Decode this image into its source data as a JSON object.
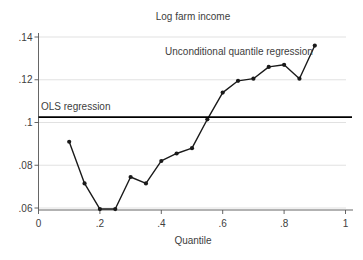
{
  "chart_data": {
    "type": "line",
    "title": "Log farm income",
    "xlabel": "Quantile",
    "ylabel": "",
    "xlim": [
      0,
      1.03
    ],
    "ylim": [
      0.055,
      0.142
    ],
    "grid": "horizontal",
    "legend_position": "none (direct line labels)",
    "x_ticks": {
      "values": [
        0,
        0.2,
        0.4,
        0.6,
        0.8,
        1
      ],
      "labels": [
        "0",
        ".2",
        ".4",
        ".6",
        ".8",
        "1"
      ]
    },
    "y_ticks": {
      "values": [
        0.06,
        0.08,
        0.1,
        0.12,
        0.14
      ],
      "labels": [
        ".06",
        ".08",
        ".1",
        ".12",
        ".14"
      ]
    },
    "series": [
      {
        "name": "Unconditional quantile regression",
        "style": "line+markers",
        "x": [
          0.1,
          0.15,
          0.2,
          0.25,
          0.3,
          0.35,
          0.4,
          0.45,
          0.5,
          0.55,
          0.6,
          0.65,
          0.7,
          0.75,
          0.8,
          0.85,
          0.9
        ],
        "y": [
          0.091,
          0.0715,
          0.0595,
          0.0595,
          0.0745,
          0.0715,
          0.082,
          0.0855,
          0.088,
          0.1015,
          0.114,
          0.1195,
          0.1205,
          0.126,
          0.127,
          0.1205,
          0.136
        ]
      },
      {
        "name": "OLS regression",
        "style": "hline",
        "value": 0.1025
      }
    ],
    "annotations": [
      {
        "text": "Unconditional quantile regression"
      },
      {
        "text": "OLS regression"
      }
    ],
    "colors": {
      "series_line": "#1a1a1a",
      "marker": "#1a1a1a",
      "ols_line": "#000000",
      "grid": "#dedede",
      "axis": "#555555",
      "text": "#404040",
      "background": "#ffffff"
    }
  }
}
